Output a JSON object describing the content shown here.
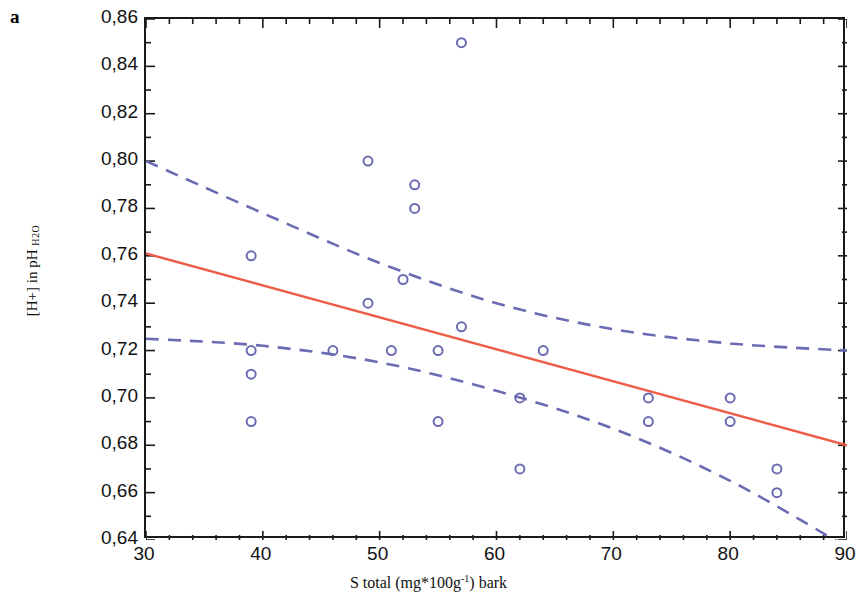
{
  "panel": {
    "label": "a"
  },
  "chart_data": {
    "type": "scatter",
    "title": "",
    "subtitle": "",
    "xlabel": "S total (mg*100g-1) bark",
    "xlabel_parts": {
      "before": "S total (mg*100g",
      "sup": "-1",
      "after": ") bark"
    },
    "ylabel": "[H+] in pH H2O",
    "ylabel_parts": {
      "main": "[H+] in pH ",
      "sub": "H2O"
    },
    "xlim": [
      30,
      90
    ],
    "ylim": [
      0.64,
      0.86
    ],
    "xticks": [
      30,
      40,
      50,
      60,
      70,
      80,
      90
    ],
    "xtick_labels": [
      "30",
      "40",
      "50",
      "60",
      "70",
      "80",
      "90"
    ],
    "x_minor_tick_step": 2,
    "yticks": [
      0.64,
      0.66,
      0.68,
      0.7,
      0.72,
      0.74,
      0.76,
      0.78,
      0.8,
      0.82,
      0.84,
      0.86
    ],
    "ytick_labels": [
      "0,64",
      "0,66",
      "0,68",
      "0,70",
      "0,72",
      "0,74",
      "0,76",
      "0,78",
      "0,80",
      "0,82",
      "0,84",
      "0,86"
    ],
    "y_minor_tick_step": 0.01,
    "grid": false,
    "legend": "none",
    "decimal_separator": ",",
    "marker": {
      "style": "open-circle",
      "color": "#6b6bb4",
      "size": 9
    },
    "points": [
      {
        "x": 39,
        "y": 0.76
      },
      {
        "x": 39,
        "y": 0.72
      },
      {
        "x": 39,
        "y": 0.71
      },
      {
        "x": 39,
        "y": 0.69
      },
      {
        "x": 46,
        "y": 0.72
      },
      {
        "x": 49,
        "y": 0.8
      },
      {
        "x": 49,
        "y": 0.74
      },
      {
        "x": 51,
        "y": 0.72
      },
      {
        "x": 52,
        "y": 0.75
      },
      {
        "x": 53,
        "y": 0.79
      },
      {
        "x": 53,
        "y": 0.78
      },
      {
        "x": 55,
        "y": 0.72
      },
      {
        "x": 55,
        "y": 0.69
      },
      {
        "x": 57,
        "y": 0.85
      },
      {
        "x": 57,
        "y": 0.73
      },
      {
        "x": 62,
        "y": 0.7
      },
      {
        "x": 62,
        "y": 0.67
      },
      {
        "x": 64,
        "y": 0.72
      },
      {
        "x": 73,
        "y": 0.7
      },
      {
        "x": 73,
        "y": 0.69
      },
      {
        "x": 80,
        "y": 0.7
      },
      {
        "x": 80,
        "y": 0.69
      },
      {
        "x": 84,
        "y": 0.67
      },
      {
        "x": 84,
        "y": 0.66
      }
    ],
    "series": [
      {
        "name": "regression line",
        "type": "line",
        "style": "solid",
        "color": "#ee5c48",
        "x": [
          30,
          90
        ],
        "values": [
          0.761,
          0.68
        ]
      },
      {
        "name": "upper confidence band",
        "type": "line",
        "style": "dashed",
        "color": "#6b6bb4",
        "x": [
          30,
          40,
          50,
          60,
          70,
          80,
          90
        ],
        "values": [
          0.8,
          0.778,
          0.757,
          0.74,
          0.729,
          0.723,
          0.72
        ]
      },
      {
        "name": "lower confidence band",
        "type": "line",
        "style": "dashed",
        "color": "#6b6bb4",
        "x": [
          30,
          40,
          50,
          60,
          70,
          80,
          90
        ],
        "values": [
          0.725,
          0.722,
          0.715,
          0.703,
          0.687,
          0.665,
          0.637
        ]
      }
    ]
  }
}
